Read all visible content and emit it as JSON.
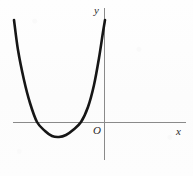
{
  "figure": {
    "kind": "coordinate-plane-parabola-sketch",
    "background_color": "#fdfdfd",
    "axis_color": "#8a8a8a",
    "curve_color": "#161616"
  },
  "labels": {
    "y_axis": "y",
    "x_axis": "x",
    "origin": "O"
  },
  "chart_data": {
    "type": "line",
    "title": "",
    "subtitle": "",
    "xlabel": "x",
    "ylabel": "y",
    "annotations": [
      "O"
    ],
    "legend": [],
    "legend_position": "none",
    "grid": false,
    "axes": {
      "origin_px": [
        104,
        122
      ],
      "x_axis_px": {
        "y": 122,
        "x_start": 13,
        "x_end": 186
      },
      "y_axis_px": {
        "x": 104,
        "y_start": 8,
        "y_end": 160
      },
      "x_tick_labels": [],
      "y_tick_labels": [],
      "xlim": [
        -5.4,
        3.5
      ],
      "ylim": [
        -1.6,
        5.4
      ]
    },
    "series": [
      {
        "name": "parabola",
        "shape": "upward-opening parabola",
        "vertex": [
          -2.3,
          -0.6
        ],
        "x_intercepts": [
          -3.4,
          -1.2
        ],
        "y_intercept": 4.7,
        "opens": "up",
        "points_px": [
          [
            14,
            20
          ],
          [
            18,
            50
          ],
          [
            24,
            80
          ],
          [
            30,
            103
          ],
          [
            37,
            122
          ],
          [
            45,
            131
          ],
          [
            52,
            136
          ],
          [
            59,
            137
          ],
          [
            66,
            135
          ],
          [
            73,
            130
          ],
          [
            81,
            122
          ],
          [
            88,
            107
          ],
          [
            94,
            85
          ],
          [
            99,
            58
          ],
          [
            103,
            32
          ],
          [
            105,
            20
          ]
        ]
      }
    ]
  }
}
